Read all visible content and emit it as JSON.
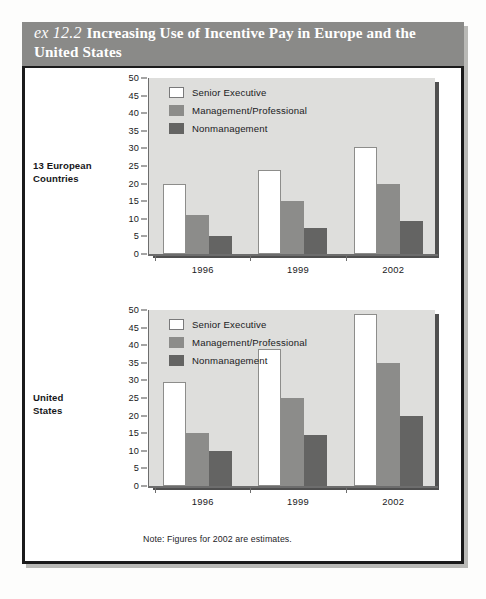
{
  "header": {
    "exhibit_label": "ex 12.2",
    "title": "Increasing Use of Incentive Pay in Europe and the United States"
  },
  "footnote": "Note: Figures for 2002 are estimates.",
  "legend_entries": [
    {
      "label": "Senior Executive",
      "key": "senior",
      "color": "#ffffff"
    },
    {
      "label": "Management/Professional",
      "key": "mgmt",
      "color": "#8c8c8a"
    },
    {
      "label": "Nonmanagement",
      "key": "nonmgmt",
      "color": "#646463"
    }
  ],
  "panels": [
    {
      "side_label_line1": "13 European",
      "side_label_line2": "Countries"
    },
    {
      "side_label_line1": "United",
      "side_label_line2": "States"
    }
  ],
  "chart_data": [
    {
      "type": "bar",
      "title": "13 European Countries",
      "categories": [
        "1996",
        "1999",
        "2002"
      ],
      "series": [
        {
          "name": "Senior Executive",
          "values": [
            20,
            24,
            30.5
          ],
          "color": "#ffffff"
        },
        {
          "name": "Management/Professional",
          "values": [
            11,
            15,
            20
          ],
          "color": "#8c8c8a"
        },
        {
          "name": "Nonmanagement",
          "values": [
            5,
            7.5,
            9.5
          ],
          "color": "#646463"
        }
      ],
      "xlabel": "",
      "ylabel": "",
      "ylim": [
        0,
        50
      ],
      "yticks": [
        0,
        5,
        10,
        15,
        20,
        25,
        30,
        35,
        40,
        45,
        50
      ],
      "grid": false,
      "legend_position": "top-left"
    },
    {
      "type": "bar",
      "title": "United States",
      "categories": [
        "1996",
        "1999",
        "2002"
      ],
      "series": [
        {
          "name": "Senior Executive",
          "values": [
            29.5,
            39,
            49
          ],
          "color": "#ffffff"
        },
        {
          "name": "Management/Professional",
          "values": [
            15,
            25,
            35
          ],
          "color": "#8c8c8a"
        },
        {
          "name": "Nonmanagement",
          "values": [
            10,
            14.5,
            20
          ],
          "color": "#646463"
        }
      ],
      "xlabel": "",
      "ylabel": "",
      "ylim": [
        0,
        50
      ],
      "yticks": [
        0,
        5,
        10,
        15,
        20,
        25,
        30,
        35,
        40,
        45,
        50
      ],
      "grid": false,
      "legend_position": "top-left"
    }
  ]
}
